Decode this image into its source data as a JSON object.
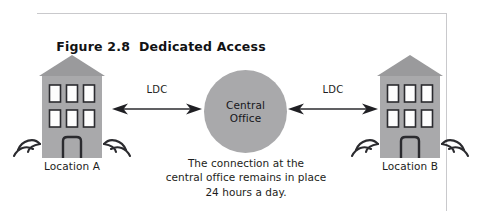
{
  "figure": {
    "number": "Figure 2.8",
    "title": "Dedicated Access"
  },
  "nodes": {
    "left_site": {
      "label": "Location A",
      "icon": "office-building-icon"
    },
    "right_site": {
      "label": "Location B",
      "icon": "office-building-icon"
    },
    "central_office": {
      "line1": "Central",
      "line2": "Office",
      "icon": "circle-node-icon"
    }
  },
  "links": [
    {
      "label": "LDC",
      "icon": "double-headed-arrow-icon"
    },
    {
      "label": "LDC",
      "icon": "double-headed-arrow-icon"
    }
  ],
  "caption": {
    "line1": "The connection at the",
    "line2": "central office remains in place",
    "line3": "24 hours a day."
  },
  "colors": {
    "building_fill": "#a9a9ab",
    "roof_fill": "#9a9a9c",
    "circle_fill": "#a9a9ab",
    "window_fill": "#fdfdfd",
    "outline": "#2b2b2f",
    "rule": "#c9c9cc",
    "text": "#1d1d20"
  }
}
